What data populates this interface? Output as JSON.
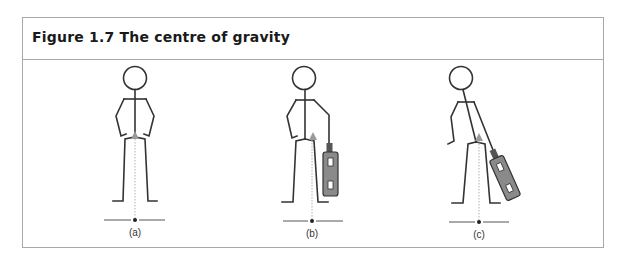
{
  "figure": {
    "title": "Figure 1.7 The centre of gravity",
    "panels": [
      {
        "label": "(a)",
        "description": "Standing figure, hands on hips, centre of gravity over midline"
      },
      {
        "label": "(b)",
        "description": "Figure carrying a case in right hand, centre of gravity shifted toward case"
      },
      {
        "label": "(c)",
        "description": "Figure leaning, carrying a case at an angle, centre of gravity shifted further"
      }
    ]
  },
  "colors": {
    "stroke": "#333333",
    "frame": "#a8a8a8",
    "case_fill": "#8a8a8a",
    "cog_marker": "#9a9a9a",
    "plumb_line": "#b0b0b0"
  }
}
